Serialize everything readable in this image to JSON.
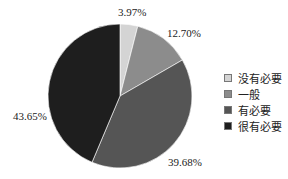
{
  "chart_data": {
    "type": "pie",
    "title": "",
    "categories": [
      "没有必要",
      "一般",
      "有必要",
      "很有必要"
    ],
    "values": [
      3.97,
      12.7,
      39.68,
      43.65
    ],
    "labels": [
      "3.97%",
      "12.70%",
      "39.68%",
      "43.65%"
    ],
    "colors": [
      "#d4d4d4",
      "#8c8c8c",
      "#555555",
      "#1e1e1e"
    ],
    "start_angle": "12 o'clock",
    "direction": "clockwise",
    "legend_position": "right"
  },
  "legend": {
    "items": [
      {
        "label": "没有必要",
        "color": "#d4d4d4"
      },
      {
        "label": "一般",
        "color": "#8c8c8c"
      },
      {
        "label": "有必要",
        "color": "#555555"
      },
      {
        "label": "很有必要",
        "color": "#1e1e1e"
      }
    ]
  },
  "data_labels": {
    "l0": "3.97%",
    "l1": "12.70%",
    "l2": "39.68%",
    "l3": "43.65%"
  }
}
